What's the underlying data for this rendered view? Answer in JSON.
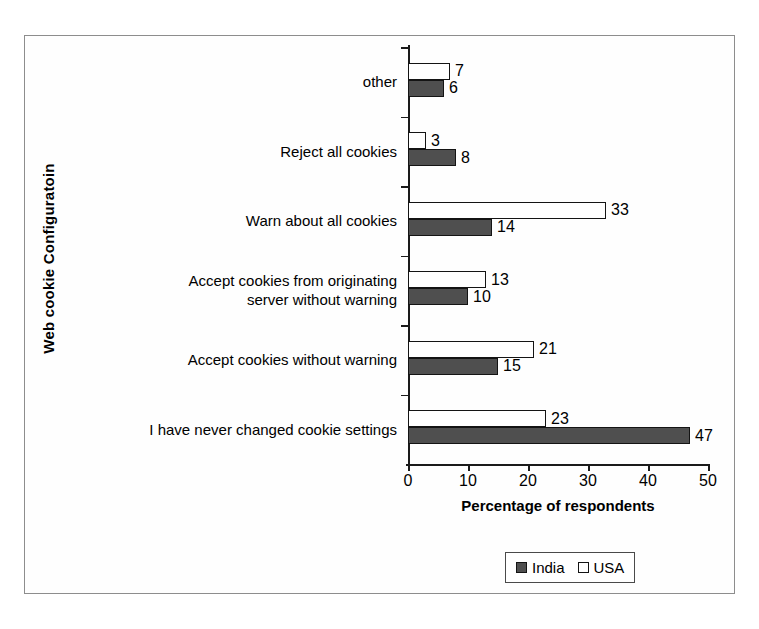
{
  "chart_data": {
    "type": "bar",
    "orientation": "horizontal",
    "title": "",
    "xlabel": "Percentage of respondents",
    "ylabel": "Web cookie Configuratoin",
    "xlim": [
      0,
      50
    ],
    "xticks": [
      0,
      10,
      20,
      30,
      40,
      50
    ],
    "grid": false,
    "legend_position": "bottom-right",
    "categories": [
      "I have never changed cookie settings",
      "Accept cookies without warning",
      "Accept cookies from originating\nserver without warning",
      "Warn about all cookies",
      "Reject all cookies",
      "other"
    ],
    "series": [
      {
        "name": "India",
        "color": "#4f4f4f",
        "values": [
          47,
          15,
          10,
          14,
          8,
          6
        ]
      },
      {
        "name": "USA",
        "color": "#ffffff",
        "values": [
          23,
          21,
          13,
          33,
          3,
          7
        ]
      }
    ],
    "data_labels": true
  },
  "axis": {
    "y_title": "Web cookie Configuratoin",
    "x_title": "Percentage of respondents",
    "x_tick_labels": [
      "0",
      "10",
      "20",
      "30",
      "40",
      "50"
    ]
  },
  "legend": {
    "items": [
      {
        "label": "India",
        "swatch": "filled-dark"
      },
      {
        "label": "USA",
        "swatch": "hollow-white"
      }
    ]
  }
}
